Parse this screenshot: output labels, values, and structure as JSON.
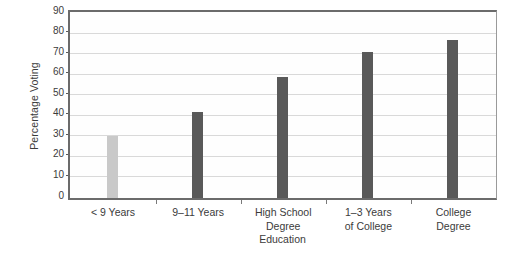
{
  "chart_data": {
    "type": "bar",
    "title": "",
    "xlabel": "Education",
    "ylabel": "Percentage Voting",
    "categories": [
      "< 9 Years",
      "9–11 Years",
      "High School\nDegree",
      "1–3 Years\nof College",
      "College\nDegree"
    ],
    "values": [
      30,
      42,
      59,
      71,
      77
    ],
    "ylim": [
      0,
      90
    ],
    "yticks": [
      0,
      10,
      20,
      30,
      40,
      50,
      60,
      70,
      80,
      90
    ],
    "ytick_labels": [
      "0",
      "10",
      "20",
      "30",
      "40",
      "50",
      "60",
      "70",
      "80",
      "90"
    ],
    "grid": "horizontal",
    "legend": "none",
    "bar_colors": [
      "#c9c9c9",
      "#595959",
      "#595959",
      "#595959",
      "#595959"
    ],
    "series": [
      {
        "name": "Percentage Voting",
        "values": [
          30,
          42,
          59,
          71,
          77
        ]
      }
    ],
    "colors": {
      "bar_light": "#c9c9c9",
      "bar_dark": "#595959",
      "gridline": "#d9d9d9",
      "axis": "#6b6b6b",
      "text": "#3b3b3b",
      "plot_background": "#fefefe",
      "page_background": "#ffffff"
    }
  }
}
